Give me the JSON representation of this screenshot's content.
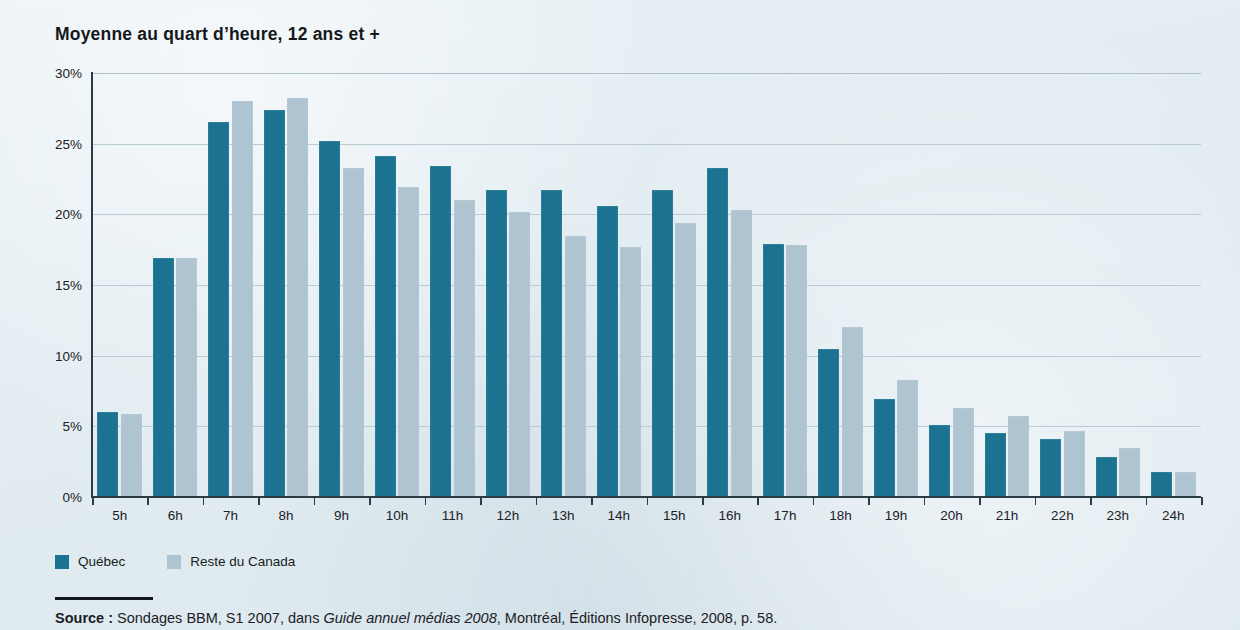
{
  "chart_data": {
    "type": "bar",
    "title": "Moyenne au quart d’heure, 12 ans et +",
    "xlabel": "",
    "ylabel": "",
    "ylim": [
      0,
      30
    ],
    "ytick_step": 5,
    "ytick_labels": [
      "30%",
      "25%",
      "20%",
      "15%",
      "10%",
      "5%",
      "0%"
    ],
    "ytick_values": [
      30,
      25,
      20,
      15,
      10,
      5,
      0
    ],
    "grid": true,
    "legend_position": "bottom-left",
    "categories": [
      "5h",
      "6h",
      "7h",
      "8h",
      "9h",
      "10h",
      "11h",
      "12h",
      "13h",
      "14h",
      "15h",
      "16h",
      "17h",
      "18h",
      "19h",
      "20h",
      "21h",
      "22h",
      "23h",
      "24h"
    ],
    "series": [
      {
        "name": "Québec",
        "color": "#1b7391",
        "values": [
          6.0,
          16.9,
          26.5,
          27.4,
          25.2,
          24.1,
          23.4,
          21.7,
          21.7,
          20.6,
          21.7,
          23.3,
          17.9,
          10.5,
          6.9,
          5.1,
          4.5,
          4.1,
          2.8,
          1.8
        ]
      },
      {
        "name": "Reste du Canada",
        "color": "#aec4d1",
        "values": [
          5.9,
          16.9,
          28.0,
          28.2,
          23.3,
          21.9,
          21.0,
          20.2,
          18.5,
          17.7,
          19.4,
          20.3,
          17.8,
          12.0,
          8.3,
          6.3,
          5.7,
          4.7,
          3.5,
          1.8
        ]
      }
    ]
  },
  "legend": {
    "items": [
      {
        "label": "Québec",
        "color": "#1b7391"
      },
      {
        "label": "Reste du Canada",
        "color": "#aec4d1"
      }
    ]
  },
  "source": {
    "label": "Source :",
    "text_before": " Sondages BBM, S1 2007, dans ",
    "italic": "Guide annuel médias 2008",
    "text_after": ", Montréal, Éditions Infopresse, 2008, p. 58."
  },
  "colors": {
    "background": "#e4edf2",
    "axis": "#2c3c45",
    "gridline": "#b9ccd6",
    "quebec": "#1b7391",
    "reste_du_canada": "#aec4d1",
    "text": "#1b2126"
  }
}
